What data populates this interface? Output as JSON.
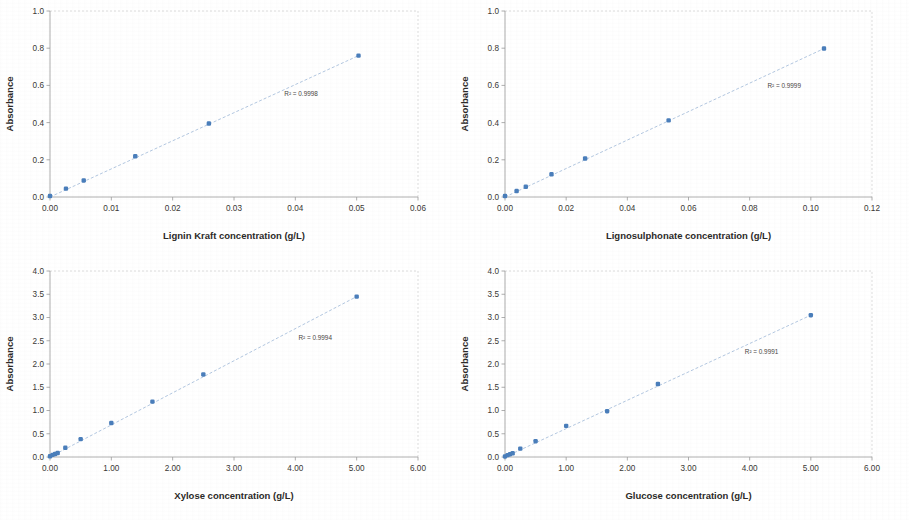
{
  "figure": {
    "background_color": "#ffffff",
    "marker_color": "#4a7ebb",
    "trendline_color": "#9fb9d8",
    "axis_color": "#9b9b9b",
    "panel_count": 4
  },
  "chart_data": [
    {
      "type": "scatter",
      "title": "",
      "xlabel": "Lignin Kraft concentration (g/L)",
      "ylabel": "Absorbance",
      "xlim": [
        0,
        0.06
      ],
      "ylim": [
        0,
        1.0
      ],
      "xticks": [
        0,
        0.01,
        0.02,
        0.03,
        0.04,
        0.05,
        0.06
      ],
      "xticklabels": [
        "0.00",
        "0.01",
        "0.02",
        "0.03",
        "0.04",
        "0.05",
        "0.06"
      ],
      "yticks": [
        0,
        0.2,
        0.4,
        0.6,
        0.8,
        1.0
      ],
      "yticklabels": [
        "0.0",
        "0.2",
        "0.4",
        "0.6",
        "0.8",
        "1.0"
      ],
      "grid": false,
      "legend": "none",
      "annotation": "R² = 0.9998",
      "annotation_x": 0.0382,
      "annotation_y": 0.545,
      "x": [
        0.0,
        0.0026,
        0.0055,
        0.0139,
        0.0259,
        0.0503
      ],
      "y": [
        0.005,
        0.045,
        0.089,
        0.219,
        0.395,
        0.76
      ],
      "trendline": {
        "x": [
          0.0,
          0.0503
        ],
        "y": [
          0.0,
          0.76
        ]
      }
    },
    {
      "type": "scatter",
      "title": "",
      "xlabel": "Lignosulphonate concentration (g/L)",
      "ylabel": "Absorbance",
      "xlim": [
        0,
        0.12
      ],
      "ylim": [
        0,
        1.0
      ],
      "xticks": [
        0,
        0.02,
        0.04,
        0.06,
        0.08,
        0.1,
        0.12
      ],
      "xticklabels": [
        "0.00",
        "0.02",
        "0.04",
        "0.06",
        "0.08",
        "0.10",
        "0.12"
      ],
      "yticks": [
        0,
        0.2,
        0.4,
        0.6,
        0.8,
        1.0
      ],
      "yticklabels": [
        "0.0",
        "0.2",
        "0.4",
        "0.6",
        "0.8",
        "1.0"
      ],
      "grid": false,
      "legend": "none",
      "annotation": "R² = 0.9999",
      "annotation_x": 0.0858,
      "annotation_y": 0.585,
      "x": [
        0.0,
        0.0038,
        0.0068,
        0.0152,
        0.0262,
        0.0535,
        0.1043
      ],
      "y": [
        0.005,
        0.032,
        0.055,
        0.122,
        0.207,
        0.412,
        0.798
      ],
      "trendline": {
        "x": [
          0.0,
          0.1043
        ],
        "y": [
          0.0,
          0.798
        ]
      }
    },
    {
      "type": "scatter",
      "title": "",
      "xlabel": "Xylose concentration (g/L)",
      "ylabel": "Absorbance",
      "xlim": [
        0,
        6.0
      ],
      "ylim": [
        0,
        4.0
      ],
      "xticks": [
        0,
        1,
        2,
        3,
        4,
        5,
        6
      ],
      "xticklabels": [
        "0.00",
        "1.00",
        "2.00",
        "3.00",
        "4.00",
        "5.00",
        "6.00"
      ],
      "yticks": [
        0,
        0.5,
        1.0,
        1.5,
        2.0,
        2.5,
        3.0,
        3.5,
        4.0
      ],
      "yticklabels": [
        "0.0",
        "0.5",
        "1.0",
        "1.5",
        "2.0",
        "2.5",
        "3.0",
        "3.5",
        "4.0"
      ],
      "grid": false,
      "legend": "none",
      "annotation": "R² = 0.9994",
      "annotation_x": 4.05,
      "annotation_y": 2.52,
      "x": [
        0.0,
        0.042,
        0.083,
        0.125,
        0.25,
        0.5,
        1.0,
        1.67,
        2.5,
        5.0
      ],
      "y": [
        0.015,
        0.045,
        0.065,
        0.085,
        0.198,
        0.385,
        0.73,
        1.19,
        1.775,
        3.45
      ],
      "trendline": {
        "x": [
          0.0,
          5.0
        ],
        "y": [
          0.0,
          3.45
        ]
      }
    },
    {
      "type": "scatter",
      "title": "",
      "xlabel": "Glucose concentration (g/L)",
      "ylabel": "Absorbance",
      "xlim": [
        0,
        6.0
      ],
      "ylim": [
        0,
        4.0
      ],
      "xticks": [
        0,
        1,
        2,
        3,
        4,
        5,
        6
      ],
      "xticklabels": [
        "0.00",
        "1.00",
        "2.00",
        "3.00",
        "4.00",
        "5.00",
        "6.00"
      ],
      "yticks": [
        0,
        0.5,
        1.0,
        1.5,
        2.0,
        2.5,
        3.0,
        3.5,
        4.0
      ],
      "yticklabels": [
        "0.0",
        "0.5",
        "1.0",
        "1.5",
        "2.0",
        "2.5",
        "3.0",
        "3.5",
        "4.0"
      ],
      "grid": false,
      "legend": "none",
      "annotation": "R² = 0.9991",
      "annotation_x": 3.92,
      "annotation_y": 2.22,
      "x": [
        0.0,
        0.042,
        0.083,
        0.125,
        0.25,
        0.5,
        1.0,
        1.67,
        2.5,
        5.0
      ],
      "y": [
        0.012,
        0.04,
        0.06,
        0.08,
        0.18,
        0.34,
        0.67,
        0.985,
        1.57,
        3.05
      ],
      "trendline": {
        "x": [
          0.0,
          5.0
        ],
        "y": [
          0.0,
          3.05
        ]
      }
    }
  ]
}
